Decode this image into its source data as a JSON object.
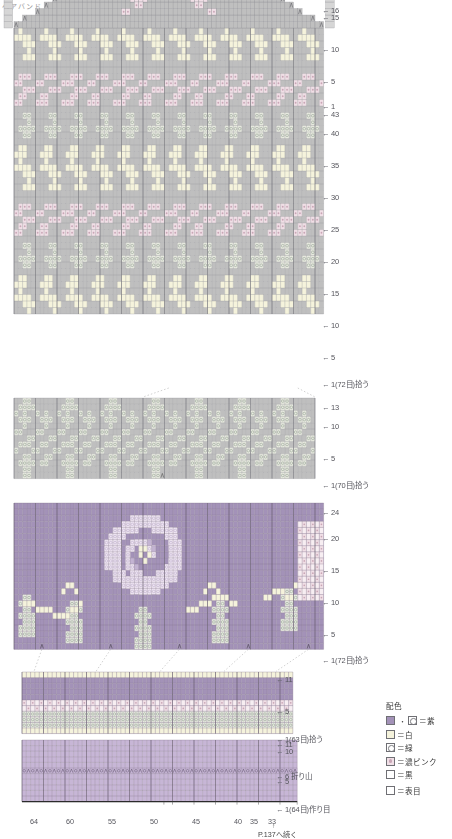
{
  "document": {
    "title_mark": "ヘアバンド",
    "footer_note": "P.137へ続く",
    "footer_marker": "↑"
  },
  "legend": {
    "title": "配色",
    "entries": [
      {
        "swatches": [
          "purple",
          "dotted"
        ],
        "separator": "・",
        "label": "＝紫"
      },
      {
        "swatches": [
          "white"
        ],
        "label": "＝白"
      },
      {
        "swatches": [
          "green"
        ],
        "label": "＝緑"
      },
      {
        "swatches": [
          "pinkdot"
        ],
        "label": "＝濃ピンク"
      },
      {
        "swatches": [
          "black"
        ],
        "label": "＝黒"
      },
      {
        "swatches": [
          "plain"
        ],
        "label": "＝表目"
      }
    ]
  },
  "colors": {
    "purple": "#a392b8",
    "purple_light": "#c3b3d2",
    "white": "#f5f3dc",
    "green": "#e8eae0",
    "pink": "#f0dfe6",
    "pink_dark": "#c9a6b6",
    "grey": "#bfbfbf",
    "grey_light": "#d6d6d6",
    "black": "#3a3a3a",
    "grid_line": "#8d8d92",
    "bg": "#ffffff"
  },
  "charts": [
    {
      "name": "crown-chart",
      "stitches": 72,
      "rows": 59,
      "row_labels": [
        {
          "row": 59,
          "text": "16"
        },
        {
          "row": 58,
          "text": "15"
        },
        {
          "row": 53,
          "text": "10"
        },
        {
          "row": 48,
          "text": "5"
        },
        {
          "row": 44,
          "text": "1"
        },
        {
          "row": 43,
          "text": "43"
        },
        {
          "row": 40,
          "text": "40"
        },
        {
          "row": 35,
          "text": "35"
        },
        {
          "row": 30,
          "text": "30"
        },
        {
          "row": 25,
          "text": "25"
        },
        {
          "row": 20,
          "text": "20"
        },
        {
          "row": 15,
          "text": "15"
        },
        {
          "row": 10,
          "text": "10"
        },
        {
          "row": 5,
          "text": "5"
        },
        {
          "row": 1,
          "text": "1(72目)拾う"
        }
      ]
    },
    {
      "name": "band-chart",
      "stitches": 70,
      "rows": 13,
      "row_labels": [
        {
          "row": 13,
          "text": "13"
        },
        {
          "row": 10,
          "text": "10"
        },
        {
          "row": 5,
          "text": "5"
        },
        {
          "row": 1,
          "text": "1(70目)拾う"
        }
      ]
    },
    {
      "name": "flower-chart",
      "stitches": 72,
      "rows": 24,
      "row_labels": [
        {
          "row": 24,
          "text": "24"
        },
        {
          "row": 20,
          "text": "20"
        },
        {
          "row": 15,
          "text": "15"
        },
        {
          "row": 10,
          "text": "10"
        },
        {
          "row": 5,
          "text": "5"
        },
        {
          "row": 1,
          "text": "1(72目)拾う"
        }
      ]
    },
    {
      "name": "edge-chart-upper",
      "stitches": 63,
      "rows": 11,
      "row_labels": [
        {
          "row": 11,
          "text": "11"
        },
        {
          "row": 5,
          "text": "5"
        },
        {
          "row": 1,
          "text": "1(63目)拾う"
        }
      ]
    },
    {
      "name": "edge-chart-lower",
      "stitches": 64,
      "rows": 11,
      "row_labels": [
        {
          "row": 11,
          "text": "11"
        },
        {
          "row": 10,
          "text": "10"
        },
        {
          "row": 6,
          "text": "6 折り山"
        },
        {
          "row": 5,
          "text": "5"
        },
        {
          "row": 1,
          "text": "1(64目)作り目"
        }
      ]
    }
  ],
  "column_axis": {
    "labels": [
      "64",
      "60",
      "55",
      "50",
      "45",
      "40",
      "35",
      "33"
    ],
    "values": [
      64,
      60,
      55,
      50,
      45,
      40,
      35,
      33
    ]
  },
  "chart_data": {
    "type": "heatmap",
    "xlabel": "目 (stitches)",
    "ylabel": "段 (rows)",
    "palette_keys": [
      "purple",
      "white",
      "green",
      "pink",
      "grey",
      "black"
    ],
    "sections": [
      {
        "name": "crown-chart",
        "stitches": 72,
        "rows": 59,
        "base_color": "grey"
      },
      {
        "name": "band-chart",
        "stitches": 70,
        "rows": 13,
        "base_color": "grey"
      },
      {
        "name": "flower-chart",
        "stitches": 72,
        "rows": 24,
        "base_color": "purple"
      },
      {
        "name": "edge-chart-upper",
        "stitches": 63,
        "rows": 11,
        "base_color": "purple"
      },
      {
        "name": "edge-chart-lower",
        "stitches": 64,
        "rows": 11,
        "base_color": "purple"
      }
    ]
  }
}
